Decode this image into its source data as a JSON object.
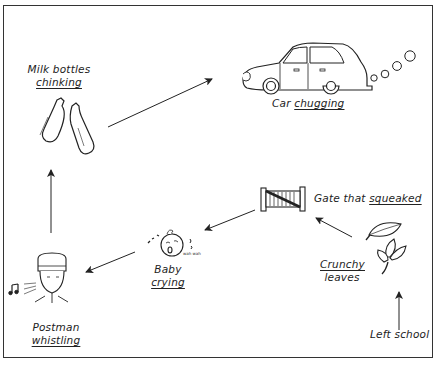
{
  "diagram": {
    "type": "flow-sequence",
    "nodes": [
      {
        "id": "left-school",
        "line1": "Left school",
        "line2": "",
        "underlined": ""
      },
      {
        "id": "crunchy-leaves",
        "line1": "Crunchy",
        "line2": "leaves",
        "underlined": "line1"
      },
      {
        "id": "gate",
        "line1": "Gate that ",
        "line1_u": "squeaked",
        "underlined": "squeaked"
      },
      {
        "id": "baby",
        "line1": "Baby",
        "line2": "crying",
        "underlined": "line2",
        "sound": "wah wah"
      },
      {
        "id": "postman",
        "line1": "Postman",
        "line2": "whistling",
        "underlined": "line2"
      },
      {
        "id": "milk",
        "line1": "Milk bottles",
        "line2": "chinking",
        "underlined": "line2"
      },
      {
        "id": "car",
        "line1": "Car ",
        "line1_u": "chugging",
        "underlined": "chugging"
      }
    ],
    "edges": [
      [
        "left-school",
        "crunchy-leaves"
      ],
      [
        "crunchy-leaves",
        "gate"
      ],
      [
        "gate",
        "baby"
      ],
      [
        "baby",
        "postman"
      ],
      [
        "postman",
        "milk"
      ],
      [
        "milk",
        "car"
      ]
    ],
    "colors": {
      "line": "#222222",
      "background": "#ffffff",
      "frame": "#333333"
    }
  }
}
